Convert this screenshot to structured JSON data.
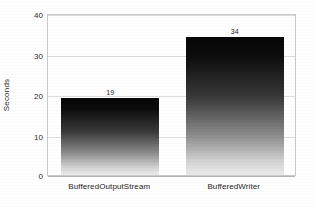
{
  "chart_data": {
    "type": "bar",
    "title": "",
    "xlabel": "",
    "ylabel": "Seconds",
    "categories": [
      "BufferedOutputStream",
      "BufferedWriter"
    ],
    "values": [
      19,
      34
    ],
    "value_labels": [
      "19",
      "34"
    ],
    "ylim": [
      0,
      40
    ],
    "y_ticks": [
      0,
      10,
      20,
      30,
      40
    ],
    "y_tick_labels": [
      "0",
      "10",
      "20",
      "30",
      "40"
    ],
    "grid": "horizontal",
    "legend": "none",
    "bar_style": {
      "fill": "vertical-gradient",
      "gradient_top": "#060606",
      "gradient_bottom": "#ececec"
    },
    "colors": {
      "background": "#ffffff",
      "gridline": "#dddddd",
      "frame": "#c9c9c9",
      "text": "#1d1d1d"
    }
  }
}
